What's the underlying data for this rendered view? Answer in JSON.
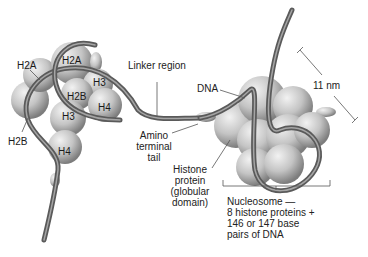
{
  "diagram": {
    "labels": {
      "h2a_outer": "H2A",
      "h2a_inner": "H2A",
      "h3_top": "H3",
      "h2b_inner": "H2B",
      "h4_right": "H4",
      "h3_mid": "H3",
      "h2b_outer": "H2B",
      "h4_bottom": "H4",
      "linker_region": "Linker region",
      "dna": "DNA",
      "dimension": "11 nm",
      "amino_tail": [
        "Amino",
        "terminal",
        "tail"
      ],
      "histone_protein": [
        "Histone",
        "protein",
        "(globular",
        "domain)"
      ],
      "nucleosome": [
        "Nucleosome —",
        "8 histone proteins +",
        "146 or 147 base",
        "pairs of DNA"
      ]
    },
    "colors": {
      "histone_fill": "#c8c8c8",
      "histone_shade": "#8a8a8a",
      "dna_strand": "#5a5a5a",
      "dna_highlight": "#9a9a9a",
      "leader_line": "#555555",
      "text": "#222222"
    }
  }
}
